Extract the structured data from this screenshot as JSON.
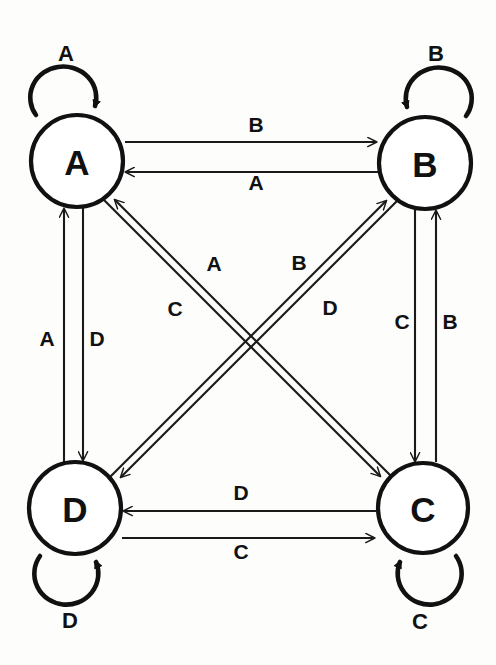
{
  "diagram": {
    "type": "state-transition-diagram",
    "background_color": "#fdfdfc",
    "stroke_color": "#111111",
    "node_fill": "#ffffff",
    "nodes": [
      {
        "id": "A",
        "label": "A",
        "cx": 77,
        "cy": 161,
        "r": 46
      },
      {
        "id": "B",
        "label": "B",
        "cx": 425,
        "cy": 163,
        "r": 46
      },
      {
        "id": "C",
        "label": "C",
        "cx": 423,
        "cy": 508,
        "r": 45
      },
      {
        "id": "D",
        "label": "D",
        "cx": 75,
        "cy": 508,
        "r": 46
      }
    ],
    "self_loops": [
      {
        "node": "A",
        "label": "A",
        "position": "top",
        "arrow_direction": "down-right",
        "label_x": 66,
        "label_y": 53
      },
      {
        "node": "B",
        "label": "B",
        "position": "top",
        "arrow_direction": "down-left",
        "label_x": 436,
        "label_y": 53
      },
      {
        "node": "C",
        "label": "C",
        "position": "bottom",
        "arrow_direction": "up-left",
        "label_x": 420,
        "label_y": 621
      },
      {
        "node": "D",
        "label": "D",
        "position": "bottom",
        "arrow_direction": "up-right",
        "label_x": 70,
        "label_y": 620
      }
    ],
    "edges": [
      {
        "from": "A",
        "to": "B",
        "label": "B",
        "label_x": 256,
        "label_y": 124,
        "orientation": "horizontal-top"
      },
      {
        "from": "B",
        "to": "A",
        "label": "A",
        "label_x": 256,
        "label_y": 182,
        "orientation": "horizontal-top"
      },
      {
        "from": "D",
        "to": "C",
        "label": "C",
        "label_x": 241,
        "label_y": 551,
        "orientation": "horizontal-bottom"
      },
      {
        "from": "C",
        "to": "D",
        "label": "D",
        "label_x": 241,
        "label_y": 492,
        "orientation": "horizontal-bottom"
      },
      {
        "from": "D",
        "to": "A",
        "label": "A",
        "label_x": 47,
        "label_y": 338,
        "orientation": "vertical-left"
      },
      {
        "from": "A",
        "to": "D",
        "label": "D",
        "label_x": 97,
        "label_y": 338,
        "orientation": "vertical-left"
      },
      {
        "from": "B",
        "to": "C",
        "label": "C",
        "label_x": 402,
        "label_y": 321,
        "orientation": "vertical-right"
      },
      {
        "from": "C",
        "to": "B",
        "label": "B",
        "label_x": 450,
        "label_y": 321,
        "orientation": "vertical-right"
      },
      {
        "from": "C",
        "to": "A",
        "label": "A",
        "label_x": 214,
        "label_y": 263,
        "orientation": "diagonal-nwse"
      },
      {
        "from": "A",
        "to": "C",
        "label": "C",
        "label_x": 175,
        "label_y": 308,
        "orientation": "diagonal-nwse"
      },
      {
        "from": "D",
        "to": "B",
        "label": "B",
        "label_x": 299,
        "label_y": 262,
        "orientation": "diagonal-swne"
      },
      {
        "from": "B",
        "to": "D",
        "label": "D",
        "label_x": 330,
        "label_y": 307,
        "orientation": "diagonal-swne"
      }
    ]
  }
}
